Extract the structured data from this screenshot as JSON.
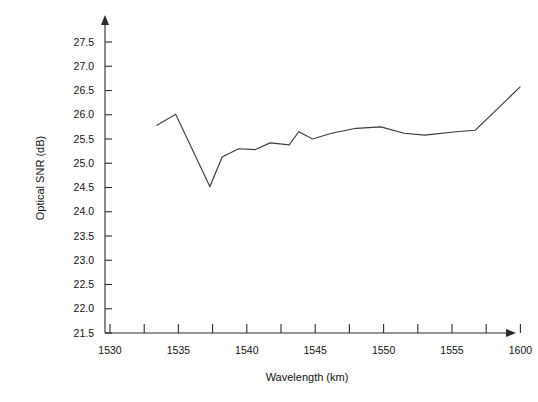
{
  "chart_data": {
    "type": "line",
    "title": "",
    "xlabel": "Wavelength (km)",
    "ylabel": "Optical SNR (dB)",
    "xlim": [
      1530,
      1560
    ],
    "ylim": [
      21.5,
      27.5
    ],
    "grid": false,
    "legend": null,
    "x_tick_labels": [
      "1530",
      "1535",
      "1540",
      "1545",
      "1550",
      "1555",
      "1600"
    ],
    "x_tick_values": [
      1530,
      1535,
      1540,
      1545,
      1550,
      1555,
      1560
    ],
    "x_minor_tick_values": [
      1532.5,
      1537.5,
      1542.5,
      1547.5,
      1552.5,
      1557.5
    ],
    "y_tick_labels": [
      "21.5",
      "22.0",
      "22.5",
      "23.0",
      "23.5",
      "24.0",
      "24.5",
      "25.0",
      "25.5",
      "26.0",
      "26.5",
      "27.0",
      "27.5"
    ],
    "y_tick_values": [
      21.5,
      22.0,
      22.5,
      23.0,
      23.5,
      24.0,
      24.5,
      25.0,
      25.5,
      26.0,
      26.5,
      27.0,
      27.5
    ],
    "series": [
      {
        "name": "Optical SNR",
        "color": "#3a3a3a",
        "x": [
          1533.4,
          1534.8,
          1537.3,
          1538.2,
          1539.4,
          1540.6,
          1541.7,
          1543.1,
          1543.8,
          1544.8,
          1546.2,
          1548.0,
          1549.8,
          1551.5,
          1553.0,
          1555.3,
          1556.7,
          1560.0
        ],
        "y": [
          25.78,
          26.01,
          24.52,
          25.13,
          25.3,
          25.28,
          25.42,
          25.38,
          25.65,
          25.5,
          25.62,
          25.72,
          25.75,
          25.62,
          25.58,
          25.65,
          25.68,
          26.58
        ]
      }
    ]
  },
  "axis": {
    "y_title": "Optical SNR (dB)",
    "x_title": "Wavelength (km)"
  }
}
